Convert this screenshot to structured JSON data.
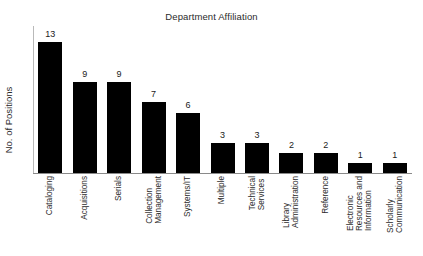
{
  "chart_data": {
    "type": "bar",
    "title": "Department Affiliation",
    "xlabel": "",
    "ylabel": "No. of Positions",
    "ylim": [
      0,
      13
    ],
    "grid": false,
    "legend": "none",
    "orientation": "vertical",
    "bar_color": "#000000",
    "axis_color": "#8a8a8a",
    "value_labels": true,
    "categories": [
      "Cataloging",
      "Acquisitions",
      "Serials",
      "Collection Management",
      "Systems/IT",
      "Multiple",
      "Technical Services",
      "Library Administration",
      "Reference",
      "Electronic Resources and Information",
      "Scholarly Communication"
    ],
    "category_lines": [
      [
        "Cataloging"
      ],
      [
        "Acquisitions"
      ],
      [
        "Serials"
      ],
      [
        "Collection",
        "Management"
      ],
      [
        "Systems/IT"
      ],
      [
        "Multiple"
      ],
      [
        "Technical",
        "Services"
      ],
      [
        "Library",
        "Administration"
      ],
      [
        "Reference"
      ],
      [
        "Electronic",
        "Resources and",
        "Information"
      ],
      [
        "Scholarly",
        "Communication"
      ]
    ],
    "values": [
      13,
      9,
      9,
      7,
      6,
      3,
      3,
      2,
      2,
      1,
      1
    ],
    "value_label_text": [
      "13",
      "9",
      "9",
      "7",
      "6",
      "3",
      "3",
      "2",
      "2",
      "1",
      "1"
    ]
  }
}
